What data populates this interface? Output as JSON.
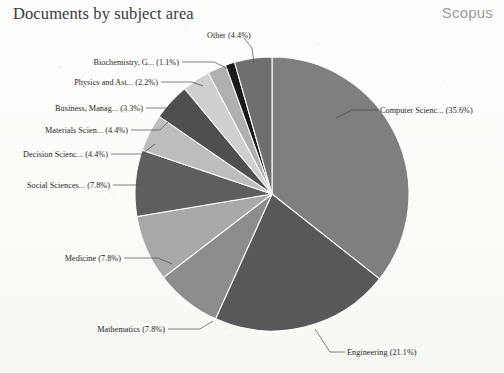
{
  "header": {
    "title": "Documents by subject area",
    "brand": "Scopus"
  },
  "chart_data": {
    "type": "pie",
    "title": "Documents by subject area",
    "xlabel": "",
    "ylabel": "",
    "legend_position": "callout-labels",
    "grid": false,
    "units": "percent",
    "start_angle_deg": 0,
    "direction": "clockwise",
    "categories": [
      "Computer Scienc...",
      "Engineering",
      "Mathematics",
      "Medicine",
      "Social Sciences...",
      "Decision Scienc...",
      "Materials Scien...",
      "Business, Manag...",
      "Physics and Ast...",
      "Biochemistry, G...",
      "Other"
    ],
    "values": [
      35.6,
      21.1,
      7.8,
      7.8,
      7.8,
      4.4,
      4.4,
      3.3,
      2.2,
      1.1,
      4.4
    ],
    "colors": [
      "#7f7f7f",
      "#585858",
      "#8c8c8c",
      "#a8a8a8",
      "#5e5e5e",
      "#bdbdbd",
      "#4f4f4f",
      "#cfcfcf",
      "#b0b0b0",
      "#1a1a1a",
      "#6f6f6f"
    ],
    "slices": [
      {
        "label": "Computer Scienc... (35.6%)",
        "name": "Computer Scienc...",
        "value": 35.6,
        "color": "#7f7f7f"
      },
      {
        "label": "Engineering (21.1%)",
        "name": "Engineering",
        "value": 21.1,
        "color": "#585858"
      },
      {
        "label": "Mathematics (7.8%)",
        "name": "Mathematics",
        "value": 7.8,
        "color": "#8c8c8c"
      },
      {
        "label": "Medicine (7.8%)",
        "name": "Medicine",
        "value": 7.8,
        "color": "#a8a8a8"
      },
      {
        "label": "Social Sciences... (7.8%)",
        "name": "Social Sciences...",
        "value": 7.8,
        "color": "#5e5e5e"
      },
      {
        "label": "Decision Scienc... (4.4%)",
        "name": "Decision Scienc...",
        "value": 4.4,
        "color": "#bdbdbd"
      },
      {
        "label": "Materials Scien... (4.4%)",
        "name": "Materials Scien...",
        "value": 4.4,
        "color": "#4f4f4f"
      },
      {
        "label": "Business, Manag... (3.3%)",
        "name": "Business, Manag...",
        "value": 3.3,
        "color": "#cfcfcf"
      },
      {
        "label": "Physics and Ast... (2.2%)",
        "name": "Physics and Ast...",
        "value": 2.2,
        "color": "#b0b0b0"
      },
      {
        "label": "Biochemistry, G... (1.1%)",
        "name": "Biochemistry, G...",
        "value": 1.1,
        "color": "#1a1a1a"
      },
      {
        "label": "Other (4.4%)",
        "name": "Other",
        "value": 4.4,
        "color": "#6f6f6f"
      }
    ]
  },
  "labels": {
    "computer_science": "Computer Scienc... (35.6%)",
    "engineering": "Engineering (21.1%)",
    "mathematics": "Mathematics (7.8%)",
    "medicine": "Medicine (7.8%)",
    "social_sciences": "Social Sciences... (7.8%)",
    "decision_sciences": "Decision Scienc... (4.4%)",
    "materials_science": "Materials Scien... (4.4%)",
    "business": "Business, Manag... (3.3%)",
    "physics": "Physics and Ast... (2.2%)",
    "biochemistry": "Biochemistry, G... (1.1%)",
    "other": "Other (4.4%)"
  }
}
